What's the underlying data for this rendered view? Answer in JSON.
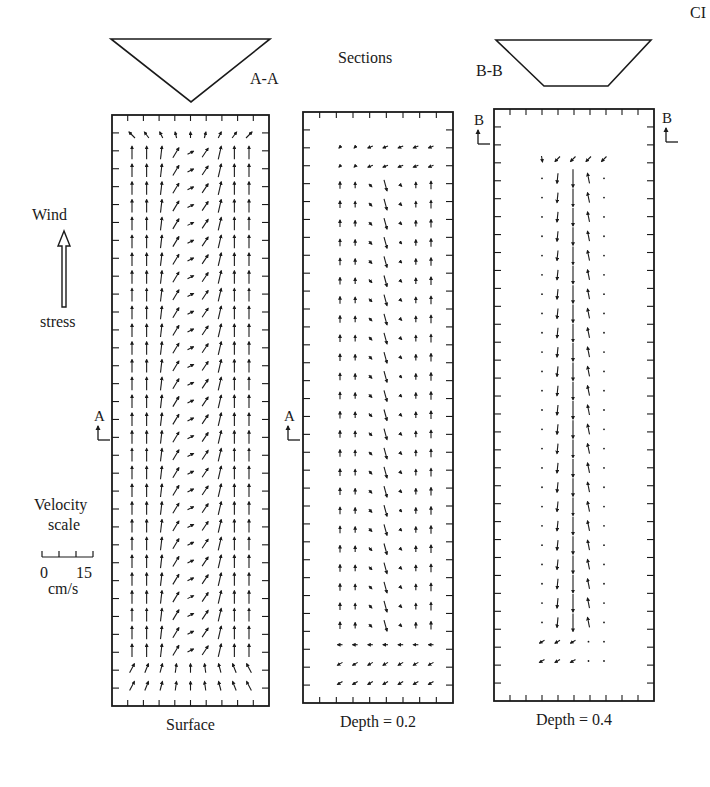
{
  "corner_label": "CI",
  "header": {
    "title": "Sections"
  },
  "sections": [
    {
      "id": "A-A",
      "label": "A-A",
      "shape": "triangle",
      "points": [
        [
          111,
          39
        ],
        [
          270,
          39
        ],
        [
          191,
          102
        ]
      ],
      "label_pos": [
        250,
        84
      ]
    },
    {
      "id": "B-B",
      "label": "B-B",
      "shape": "trapezoid",
      "points": [
        [
          496,
          40
        ],
        [
          651,
          40
        ],
        [
          608,
          86
        ],
        [
          544,
          86
        ]
      ],
      "label_pos": [
        476,
        76
      ]
    }
  ],
  "legend": {
    "wind": {
      "top_label": "Wind",
      "bottom_label": "stress",
      "direction": "north"
    },
    "velocity_scale": {
      "title_line1": "Velocity",
      "title_line2": "scale",
      "min_label": "0",
      "max_label": "15",
      "unit": "cm/s",
      "ticks": 4
    }
  },
  "markers": [
    {
      "label": "A",
      "x": 100,
      "y": 424,
      "side": "left"
    },
    {
      "label": "A",
      "x": 290,
      "y": 424,
      "side": "left"
    },
    {
      "label": "B",
      "x": 480,
      "y": 128,
      "side": "left"
    },
    {
      "label": "B",
      "x": 668,
      "y": 126,
      "side": "left"
    }
  ],
  "panels": [
    {
      "id": "surface",
      "caption": "Surface",
      "box": {
        "x": 112,
        "y": 115,
        "w": 157,
        "h": 591
      },
      "ticks": {
        "top": 10,
        "left": 33,
        "right": 33
      },
      "field": "surface"
    },
    {
      "id": "depth-0.2",
      "caption": "Depth = 0.2",
      "box": {
        "x": 303,
        "y": 112,
        "w": 150,
        "h": 591
      },
      "ticks": {
        "top": 9,
        "left": 33,
        "right": 33
      },
      "field": "depth02"
    },
    {
      "id": "depth-0.4",
      "caption": "Depth = 0.4",
      "box": {
        "x": 494,
        "y": 109,
        "w": 160,
        "h": 592
      },
      "ticks": {
        "top": 10,
        "left": 33,
        "right": 33
      },
      "field": "depth04"
    }
  ],
  "colors": {
    "ink": "#1a1a1a",
    "background": "#ffffff"
  }
}
